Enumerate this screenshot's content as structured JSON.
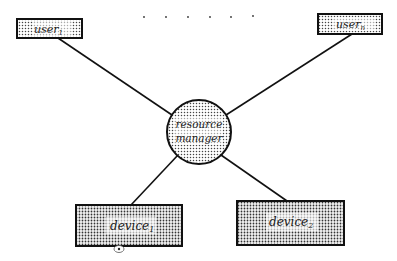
{
  "diagram": {
    "nodes": {
      "user1": {
        "label": "user",
        "subscript": "1"
      },
      "usern": {
        "label": "user",
        "subscript": "n"
      },
      "manager": {
        "line1": "resource",
        "line2": "manager"
      },
      "device1": {
        "label": "device",
        "subscript": "1"
      },
      "device2": {
        "label": "device",
        "subscript": "2"
      }
    },
    "ellipsis_dots": 6,
    "edges": [
      {
        "from": "user1",
        "to": "manager"
      },
      {
        "from": "usern",
        "to": "manager"
      },
      {
        "from": "manager",
        "to": "device1"
      },
      {
        "from": "manager",
        "to": "device2"
      }
    ],
    "colors": {
      "stroke": "#111111",
      "fill_bg": "#ffffff",
      "dot": "#333333"
    }
  }
}
